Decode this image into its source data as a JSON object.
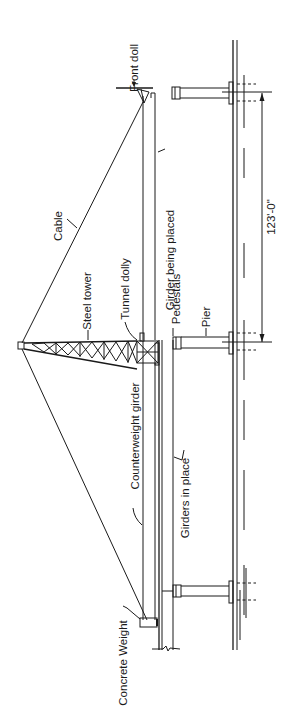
{
  "diagram": {
    "type": "bridge girder erection elevation (rotated 90°)",
    "labels": {
      "front_dolly": "Front doll",
      "girder_being_placed": "Girder being placed",
      "cable": "Cable",
      "steel_tower": "Steel tower",
      "tunnel_dolly": "Tunnel dolly",
      "pedestals": "Pedestals",
      "pier": "Pier",
      "span_dimension": "123'-0\"",
      "counterweight_girder": "Counterweight girder",
      "girders_in_place": "Girders in place",
      "concrete_weight": "Concrete Weight"
    },
    "colors": {
      "line": "#1a1a1a",
      "background": "#ffffff"
    }
  }
}
